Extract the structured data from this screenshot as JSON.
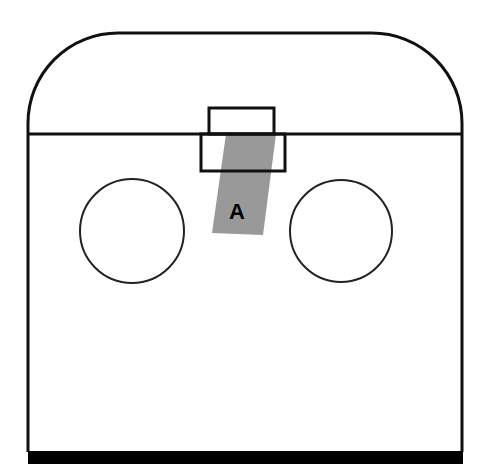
{
  "diagram": {
    "colors": {
      "stroke": "#111111",
      "band": "#999999",
      "background": "#ffffff",
      "base": "#000000"
    },
    "outer_shape": {
      "left": 28,
      "right": 462,
      "top": 33,
      "bottom": 452,
      "corner_radius": 90
    },
    "divider_line_y": 134,
    "upper_slot_rect": {
      "x": 209,
      "y": 108,
      "width": 65,
      "height": 26
    },
    "lower_slot_rect": {
      "x": 201,
      "y": 134,
      "width": 84,
      "height": 37
    },
    "band": {
      "points": [
        [
          226,
          134
        ],
        [
          276,
          134
        ],
        [
          263,
          235
        ],
        [
          212,
          233
        ]
      ],
      "label": "A"
    },
    "circles": [
      {
        "name": "left-circle",
        "cx": 132,
        "cy": 231,
        "r": 52
      },
      {
        "name": "right-circle",
        "cx": 341,
        "cy": 231,
        "r": 51
      }
    ],
    "base_bar": {
      "x": 28,
      "y": 452,
      "width": 435,
      "height": 12
    }
  }
}
